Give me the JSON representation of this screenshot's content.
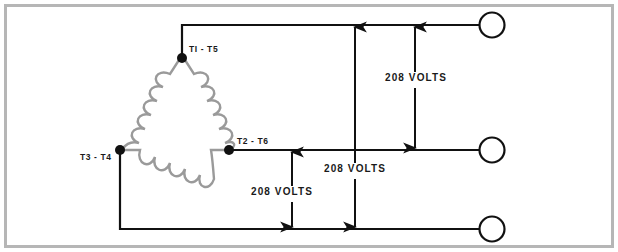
{
  "diagram": {
    "frame_color": "#b6b6b6",
    "wire_color": "#111111",
    "coil_color": "#9a9a9a",
    "background": "#ffffff",
    "node_labels": [
      {
        "id": "t1-t5",
        "text": "TI - T5"
      },
      {
        "id": "t2-t6",
        "text": "T2 - T6"
      },
      {
        "id": "t3-t4",
        "text": "T3 - T4"
      }
    ],
    "voltage_labels": [
      {
        "id": "voltage-top-right",
        "text": "208 VOLTS"
      },
      {
        "id": "voltage-middle",
        "text": "208 VOLTS"
      },
      {
        "id": "voltage-bottom-left",
        "text": "208 VOLTS"
      }
    ],
    "terminals": [
      {
        "id": "terminal-top",
        "text": ""
      },
      {
        "id": "terminal-middle",
        "text": ""
      },
      {
        "id": "terminal-bottom",
        "text": ""
      }
    ]
  }
}
